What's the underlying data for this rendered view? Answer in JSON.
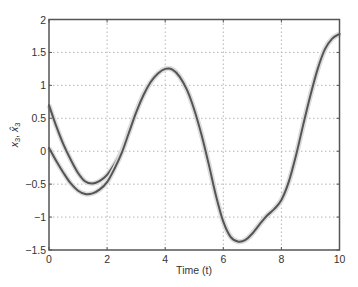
{
  "chart_data": {
    "type": "line",
    "title": "",
    "xlabel": "Time (t)",
    "ylabel": "x3, x̂3",
    "ylabel_parts": {
      "a": "x",
      "a_sub": "3",
      "sep": ", ",
      "b": "x̂",
      "b_sub": "3"
    },
    "xlim": [
      0,
      10
    ],
    "ylim": [
      -1.5,
      2
    ],
    "xticks": [
      0,
      2,
      4,
      6,
      8,
      10
    ],
    "xtick_labels": [
      "0",
      "2",
      "4",
      "6",
      "8",
      "10"
    ],
    "yticks": [
      -1.5,
      -1,
      -0.5,
      0,
      0.5,
      1,
      1.5,
      2
    ],
    "ytick_labels": [
      "−1.5",
      "−1",
      "−0.5",
      "0",
      "0.5",
      "1",
      "1.5",
      "2"
    ],
    "grid": true,
    "grid_style": "dotted",
    "legend": "none",
    "line_color": "#555555",
    "series": [
      {
        "name": "x3",
        "x": [
          0,
          0.25,
          0.5,
          0.75,
          1.0,
          1.25,
          1.5,
          1.75,
          2.0,
          2.25,
          2.5,
          2.75,
          3.0,
          3.25,
          3.5,
          3.75,
          4.0,
          4.25,
          4.5,
          4.75,
          5.0,
          5.25,
          5.5,
          5.75,
          6.0,
          6.25,
          6.5,
          6.75,
          7.0,
          7.25,
          7.5,
          7.75,
          8.0,
          8.25,
          8.5,
          8.75,
          9.0,
          9.25,
          9.5,
          9.75,
          10.0
        ],
        "y": [
          0.7,
          0.38,
          0.1,
          -0.13,
          -0.33,
          -0.46,
          -0.49,
          -0.45,
          -0.36,
          -0.2,
          0.0,
          0.3,
          0.6,
          0.86,
          1.05,
          1.18,
          1.25,
          1.24,
          1.13,
          0.93,
          0.63,
          0.25,
          -0.2,
          -0.68,
          -1.07,
          -1.3,
          -1.37,
          -1.35,
          -1.25,
          -1.11,
          -0.98,
          -0.88,
          -0.74,
          -0.47,
          -0.07,
          0.4,
          0.85,
          1.25,
          1.55,
          1.71,
          1.78
        ]
      },
      {
        "name": "x̂3",
        "x": [
          0,
          0.25,
          0.5,
          0.75,
          1.0,
          1.25,
          1.5,
          1.75,
          2.0,
          2.25,
          2.5,
          2.75,
          3.0,
          3.25,
          3.5,
          3.75,
          4.0,
          4.25,
          4.5,
          4.75,
          5.0,
          5.25,
          5.5,
          5.75,
          6.0,
          6.25,
          6.5,
          6.75,
          7.0,
          7.25,
          7.5,
          7.75,
          8.0,
          8.25,
          8.5,
          8.75,
          9.0,
          9.25,
          9.5,
          9.75,
          10.0
        ],
        "y": [
          0.05,
          -0.15,
          -0.33,
          -0.49,
          -0.6,
          -0.65,
          -0.64,
          -0.58,
          -0.47,
          -0.27,
          -0.03,
          0.28,
          0.59,
          0.85,
          1.05,
          1.18,
          1.25,
          1.24,
          1.13,
          0.93,
          0.63,
          0.25,
          -0.2,
          -0.68,
          -1.07,
          -1.3,
          -1.37,
          -1.35,
          -1.25,
          -1.11,
          -0.98,
          -0.88,
          -0.74,
          -0.47,
          -0.07,
          0.4,
          0.85,
          1.25,
          1.55,
          1.71,
          1.78
        ]
      }
    ]
  }
}
